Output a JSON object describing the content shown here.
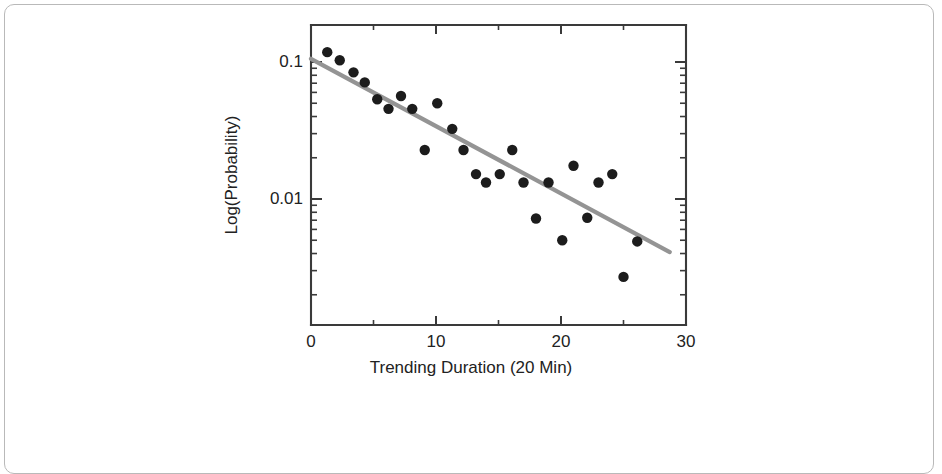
{
  "figure": {
    "card_border_color": "#b9b9b9",
    "background_color": "#ffffff"
  },
  "axis_titles": {
    "x": "Trending Duration (20 Min)",
    "y": "Log(Probability)"
  },
  "x_tick_labels": [
    "0",
    "10",
    "20",
    "30"
  ],
  "y_tick_labels": [
    "0.1",
    "0.01"
  ],
  "chart_data": {
    "type": "scatter",
    "title": "",
    "subtitle": "",
    "xlabel": "Trending Duration (20 Min)",
    "ylabel": "Log(Probability)",
    "yscale": "log",
    "xscale": "linear",
    "xlim": [
      0,
      30
    ],
    "ylim": [
      0.002,
      0.16
    ],
    "grid": false,
    "legend": null,
    "legend_position": "none",
    "x_ticks": [
      0,
      10,
      20,
      30
    ],
    "x_minor_ticks": [
      5,
      15,
      25
    ],
    "y_ticks": [
      0.1,
      0.01
    ],
    "y_tick_labels": [
      "0.1",
      "0.01"
    ],
    "marker": {
      "shape": "circle",
      "color": "#1c1c1c",
      "size_px": 5.2
    },
    "series": [
      {
        "name": "Observed probability",
        "type": "scatter",
        "color": "#1c1c1c",
        "x": [
          1.3,
          2.3,
          3.4,
          4.3,
          5.3,
          6.2,
          7.2,
          8.1,
          9.1,
          10.1,
          11.3,
          12.2,
          13.2,
          14.0,
          15.1,
          16.1,
          17.0,
          18.0,
          19.0,
          20.1,
          21.0,
          22.1,
          23.0,
          24.1,
          25.0,
          26.1
        ],
        "y": [
          0.118,
          0.103,
          0.084,
          0.071,
          0.0535,
          0.0455,
          0.0565,
          0.0455,
          0.0228,
          0.05,
          0.0325,
          0.0228,
          0.0152,
          0.0132,
          0.0152,
          0.0228,
          0.0132,
          0.0072,
          0.0132,
          0.005,
          0.0175,
          0.0073,
          0.0132,
          0.0152,
          0.0027,
          0.0049
        ]
      },
      {
        "name": "Exponential fit",
        "type": "line",
        "color": "#949494",
        "x": [
          0.0,
          28.7
        ],
        "y": [
          0.1055,
          0.0041
        ]
      }
    ]
  }
}
